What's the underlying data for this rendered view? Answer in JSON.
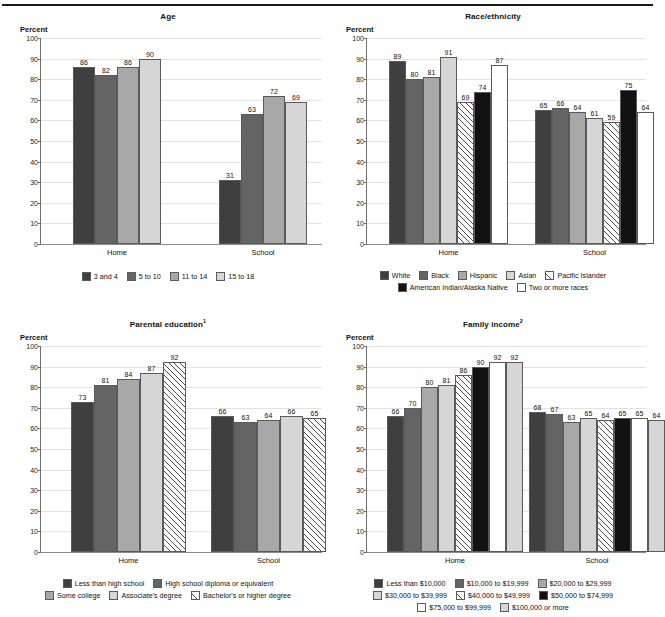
{
  "document": {
    "top_cut_text": "",
    "percent_axis_label": "Percent"
  },
  "palette": {
    "g1": "#3f3f3f",
    "g2": "#646464",
    "g3": "#a8a8a8",
    "g4": "#d6d6d6",
    "hatch": "hatch",
    "black": "#121212",
    "white": "#ffffff",
    "grid": "#e2e2e2",
    "axis": "#6f6f6f"
  },
  "chart_data": [
    {
      "id": "age",
      "type": "bar",
      "title": "Age",
      "title_note": "",
      "ylabel": "Percent",
      "xlabel": "",
      "ylim": [
        0,
        100
      ],
      "yticks": [
        0,
        10,
        20,
        30,
        40,
        50,
        60,
        70,
        80,
        90,
        100
      ],
      "grid": true,
      "legend_position": "bottom",
      "categories": [
        "Home",
        "School"
      ],
      "series": [
        {
          "name": "3 and 4",
          "fill": "#3f3f3f",
          "pattern": "solid",
          "values": [
            86,
            31
          ]
        },
        {
          "name": "5 to 10",
          "fill": "#646464",
          "pattern": "solid",
          "values": [
            82,
            63
          ]
        },
        {
          "name": "11 to 14",
          "fill": "#a8a8a8",
          "pattern": "solid",
          "values": [
            86,
            72
          ]
        },
        {
          "name": "15 to 18",
          "fill": "#d6d6d6",
          "pattern": "solid",
          "values": [
            90,
            69
          ]
        }
      ],
      "legend_rows": [
        [
          "3 and 4",
          "5 to 10",
          "11 to 14",
          "15 to 18"
        ]
      ]
    },
    {
      "id": "race",
      "type": "bar",
      "title": "Race/ethnicity",
      "title_note": "",
      "ylabel": "Percent",
      "xlabel": "",
      "ylim": [
        0,
        100
      ],
      "yticks": [
        0,
        10,
        20,
        30,
        40,
        50,
        60,
        70,
        80,
        90,
        100
      ],
      "grid": true,
      "legend_position": "bottom",
      "categories": [
        "Home",
        "School"
      ],
      "series": [
        {
          "name": "White",
          "fill": "#3f3f3f",
          "pattern": "solid",
          "values": [
            89,
            65
          ]
        },
        {
          "name": "Black",
          "fill": "#646464",
          "pattern": "solid",
          "values": [
            80,
            66
          ]
        },
        {
          "name": "Hispanic",
          "fill": "#a8a8a8",
          "pattern": "solid",
          "values": [
            81,
            64
          ]
        },
        {
          "name": "Asian",
          "fill": "#d6d6d6",
          "pattern": "solid",
          "values": [
            91,
            61
          ]
        },
        {
          "name": "Pacific Islander",
          "fill": "#ffffff",
          "pattern": "hatch",
          "values": [
            69,
            59
          ]
        },
        {
          "name": "American Indian/Alaska Native",
          "fill": "#121212",
          "pattern": "solid",
          "values": [
            74,
            75
          ]
        },
        {
          "name": "Two or more races",
          "fill": "#ffffff",
          "pattern": "solid",
          "values": [
            87,
            64
          ]
        }
      ],
      "legend_rows": [
        [
          "White",
          "Black",
          "Hispanic",
          "Asian",
          "Pacific Islander"
        ],
        [
          "American Indian/Alaska Native",
          "Two or more races"
        ]
      ]
    },
    {
      "id": "parental-education",
      "type": "bar",
      "title": "Parental education",
      "title_note": "1",
      "ylabel": "Percent",
      "xlabel": "",
      "ylim": [
        0,
        100
      ],
      "yticks": [
        0,
        10,
        20,
        30,
        40,
        50,
        60,
        70,
        80,
        90,
        100
      ],
      "grid": true,
      "legend_position": "bottom",
      "categories": [
        "Home",
        "School"
      ],
      "series": [
        {
          "name": "Less than high school",
          "fill": "#3f3f3f",
          "pattern": "solid",
          "values": [
            73,
            66
          ]
        },
        {
          "name": "High school diploma or equivalent",
          "fill": "#646464",
          "pattern": "solid",
          "values": [
            81,
            63
          ]
        },
        {
          "name": "Some college",
          "fill": "#a8a8a8",
          "pattern": "solid",
          "values": [
            84,
            64
          ]
        },
        {
          "name": "Associate's degree",
          "fill": "#d6d6d6",
          "pattern": "solid",
          "values": [
            87,
            66
          ]
        },
        {
          "name": "Bachelor's or higher degree",
          "fill": "#ffffff",
          "pattern": "hatch",
          "values": [
            92,
            65
          ]
        }
      ],
      "legend_rows": [
        [
          "Less than high school",
          "High school diploma or equivalent"
        ],
        [
          "Some college",
          "Associate's degree",
          "Bachelor's or higher degree"
        ]
      ]
    },
    {
      "id": "family-income",
      "type": "bar",
      "title": "Family income",
      "title_note": "2",
      "ylabel": "Percent",
      "xlabel": "",
      "ylim": [
        0,
        100
      ],
      "yticks": [
        0,
        10,
        20,
        30,
        40,
        50,
        60,
        70,
        80,
        90,
        100
      ],
      "grid": true,
      "legend_position": "bottom",
      "categories": [
        "Home",
        "School"
      ],
      "series": [
        {
          "name": "Less than $10,000",
          "fill": "#3f3f3f",
          "pattern": "solid",
          "values": [
            66,
            68
          ]
        },
        {
          "name": "$10,000 to $19,999",
          "fill": "#646464",
          "pattern": "solid",
          "values": [
            70,
            67
          ]
        },
        {
          "name": "$20,000 to $29,999",
          "fill": "#a8a8a8",
          "pattern": "solid",
          "values": [
            80,
            63
          ]
        },
        {
          "name": "$30,000 to $39,999",
          "fill": "#d6d6d6",
          "pattern": "solid",
          "values": [
            81,
            65
          ]
        },
        {
          "name": "$40,000 to $49,999",
          "fill": "#ffffff",
          "pattern": "hatch",
          "values": [
            86,
            64
          ]
        },
        {
          "name": "$50,000 to $74,999",
          "fill": "#121212",
          "pattern": "solid",
          "values": [
            90,
            65
          ]
        },
        {
          "name": "$75,000 to $99,999",
          "fill": "#ffffff",
          "pattern": "solid",
          "values": [
            92,
            65
          ]
        },
        {
          "name": "$100,000 or more",
          "fill": "#d6d6d6",
          "pattern": "solid",
          "values": [
            92,
            64
          ]
        }
      ],
      "legend_rows": [
        [
          "Less than $10,000",
          "$10,000 to $19,999",
          "$20,000 to $29,999"
        ],
        [
          "$30,000 to $39,999",
          "$40,000 to $49,999",
          "$50,000 to $74,999"
        ],
        [
          "$75,000 to $99,999",
          "$100,000 or more"
        ]
      ]
    }
  ]
}
